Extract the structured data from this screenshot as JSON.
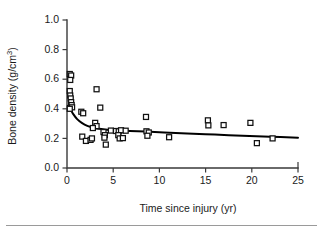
{
  "chart_data": {
    "type": "scatter",
    "title": "",
    "xlabel": "Time since injury (yr)",
    "ylabel": "Bone density (g/cm3)",
    "ylabel_base": "Bone density (g/cm",
    "ylabel_sup": "3",
    "ylabel_close": ")",
    "xlim": [
      0,
      25
    ],
    "ylim": [
      0.0,
      1.0
    ],
    "grid": false,
    "legend": null,
    "xticks": [
      0,
      5,
      10,
      15,
      20,
      25
    ],
    "xtick_labels": [
      "0",
      "5",
      "10",
      "15",
      "20",
      "25"
    ],
    "yticks": [
      0.0,
      0.2,
      0.4,
      0.6,
      0.8,
      1.0
    ],
    "ytick_labels": [
      "0.0",
      "0.2",
      "0.4",
      "0.6",
      "0.8",
      "1.0"
    ],
    "marker_style": "open-square",
    "marker_color": "#ffffff",
    "marker_edge_color": "#111111",
    "curve_color": "#000000",
    "points": [
      {
        "x": 0.3,
        "y": 0.635
      },
      {
        "x": 0.45,
        "y": 0.625
      },
      {
        "x": 0.35,
        "y": 0.595
      },
      {
        "x": 0.3,
        "y": 0.52
      },
      {
        "x": 0.35,
        "y": 0.49
      },
      {
        "x": 0.4,
        "y": 0.47
      },
      {
        "x": 0.45,
        "y": 0.445
      },
      {
        "x": 0.5,
        "y": 0.425
      },
      {
        "x": 0.55,
        "y": 0.41
      },
      {
        "x": 0.3,
        "y": 0.4
      },
      {
        "x": 1.55,
        "y": 0.38
      },
      {
        "x": 1.75,
        "y": 0.37
      },
      {
        "x": 3.2,
        "y": 0.532
      },
      {
        "x": 3.6,
        "y": 0.408
      },
      {
        "x": 3.05,
        "y": 0.305
      },
      {
        "x": 3.2,
        "y": 0.283
      },
      {
        "x": 2.8,
        "y": 0.27
      },
      {
        "x": 1.65,
        "y": 0.212
      },
      {
        "x": 2.05,
        "y": 0.183
      },
      {
        "x": 2.55,
        "y": 0.19
      },
      {
        "x": 2.7,
        "y": 0.2
      },
      {
        "x": 3.95,
        "y": 0.243
      },
      {
        "x": 4.1,
        "y": 0.222
      },
      {
        "x": 4.05,
        "y": 0.205
      },
      {
        "x": 4.2,
        "y": 0.158
      },
      {
        "x": 4.75,
        "y": 0.253
      },
      {
        "x": 5.3,
        "y": 0.25
      },
      {
        "x": 5.6,
        "y": 0.248
      },
      {
        "x": 5.85,
        "y": 0.255
      },
      {
        "x": 5.55,
        "y": 0.222
      },
      {
        "x": 5.7,
        "y": 0.2
      },
      {
        "x": 6.05,
        "y": 0.202
      },
      {
        "x": 6.35,
        "y": 0.252
      },
      {
        "x": 8.55,
        "y": 0.345
      },
      {
        "x": 8.6,
        "y": 0.248
      },
      {
        "x": 8.85,
        "y": 0.24
      },
      {
        "x": 8.7,
        "y": 0.218
      },
      {
        "x": 11.05,
        "y": 0.208
      },
      {
        "x": 15.25,
        "y": 0.322
      },
      {
        "x": 15.3,
        "y": 0.288
      },
      {
        "x": 16.95,
        "y": 0.29
      },
      {
        "x": 19.85,
        "y": 0.305
      },
      {
        "x": 20.55,
        "y": 0.168
      },
      {
        "x": 22.25,
        "y": 0.2
      }
    ],
    "curve": {
      "description": "decaying fit curve",
      "points": [
        {
          "x": 0.1,
          "y": 0.42
        },
        {
          "x": 0.35,
          "y": 0.4
        },
        {
          "x": 0.7,
          "y": 0.362
        },
        {
          "x": 1.1,
          "y": 0.33
        },
        {
          "x": 1.6,
          "y": 0.305
        },
        {
          "x": 2.2,
          "y": 0.285
        },
        {
          "x": 2.9,
          "y": 0.272
        },
        {
          "x": 3.7,
          "y": 0.263
        },
        {
          "x": 4.6,
          "y": 0.257
        },
        {
          "x": 5.6,
          "y": 0.253
        },
        {
          "x": 6.8,
          "y": 0.25
        },
        {
          "x": 8.5,
          "y": 0.246
        },
        {
          "x": 10.5,
          "y": 0.24
        },
        {
          "x": 13.0,
          "y": 0.233
        },
        {
          "x": 16.0,
          "y": 0.226
        },
        {
          "x": 19.0,
          "y": 0.218
        },
        {
          "x": 22.0,
          "y": 0.211
        },
        {
          "x": 25.0,
          "y": 0.205
        }
      ]
    }
  }
}
